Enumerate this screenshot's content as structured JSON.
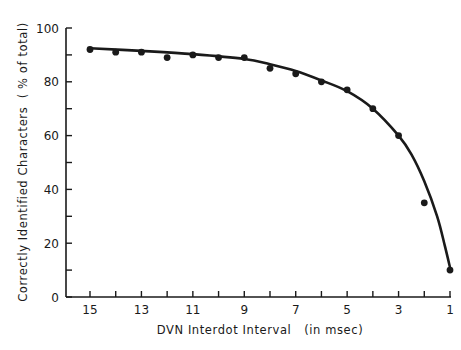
{
  "chart_data": {
    "type": "scatter",
    "title": "",
    "xlabel": "DVN Interdot Interval   (in msec)",
    "ylabel": "Correctly Identified Characters  ( % of total)",
    "xlim": [
      15,
      1
    ],
    "x_reversed": true,
    "ylim": [
      0,
      100
    ],
    "x_ticks": [
      15,
      14,
      13,
      12,
      11,
      10,
      9,
      8,
      7,
      6,
      5,
      4,
      3,
      2,
      1
    ],
    "x_tick_labels": [
      "15",
      "13",
      "11",
      "9",
      "7",
      "5",
      "3",
      "1"
    ],
    "x_tick_label_values": [
      15,
      13,
      11,
      9,
      7,
      5,
      3,
      1
    ],
    "y_ticks": [
      0,
      10,
      20,
      30,
      40,
      50,
      60,
      70,
      80,
      90,
      100
    ],
    "y_tick_labels": [
      "0",
      "20",
      "40",
      "60",
      "80",
      "100"
    ],
    "y_tick_label_values": [
      0,
      20,
      40,
      60,
      80,
      100
    ],
    "grid": false,
    "series": [
      {
        "name": "observed",
        "type": "scatter",
        "x": [
          15,
          14,
          13,
          12,
          11,
          10,
          9,
          8,
          7,
          6,
          5,
          4,
          3,
          2,
          1
        ],
        "y": [
          92,
          91,
          91,
          89,
          90,
          89,
          89,
          85,
          83,
          80,
          77,
          70,
          60,
          35,
          10
        ]
      },
      {
        "name": "fitted curve",
        "type": "line",
        "x": [
          15,
          13,
          11,
          9,
          8,
          7,
          6,
          5,
          4,
          3,
          2.5,
          2,
          1.5,
          1.2,
          1
        ],
        "y": [
          92.5,
          91.5,
          90.3,
          88.5,
          86.5,
          84,
          80.5,
          76.5,
          70,
          60,
          53,
          43,
          30,
          19,
          11
        ]
      }
    ],
    "colors": {
      "ink": "#1a1a1a",
      "background": "#ffffff"
    }
  }
}
